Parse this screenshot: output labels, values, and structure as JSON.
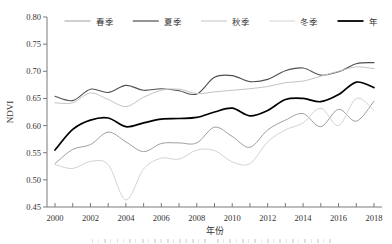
{
  "figure": {
    "caption_note": ""
  },
  "chart_data": {
    "type": "line",
    "title": "",
    "xlabel": "年份",
    "ylabel": "NDVI",
    "xlim": [
      2000,
      2018
    ],
    "ylim": [
      0.45,
      0.8
    ],
    "grid": false,
    "legend_position": "top-center-row",
    "axis_color": "#7a7a7a",
    "text_color": "#333333",
    "x": [
      2000,
      2001,
      2002,
      2003,
      2004,
      2005,
      2006,
      2007,
      2008,
      2009,
      2010,
      2011,
      2012,
      2013,
      2014,
      2015,
      2016,
      2017,
      2018
    ],
    "x_minor_tick_years": [
      2000,
      2001,
      2002,
      2003,
      2004,
      2005,
      2006,
      2007,
      2008,
      2009,
      2010,
      2011,
      2012,
      2013,
      2014,
      2015,
      2016,
      2017,
      2018
    ],
    "x_ticks_labeled": [
      {
        "value": 2000,
        "label": "2000"
      },
      {
        "value": 2002,
        "label": "2002"
      },
      {
        "value": 2004,
        "label": "2004"
      },
      {
        "value": 2006,
        "label": "2006"
      },
      {
        "value": 2008,
        "label": "2008"
      },
      {
        "value": 2010,
        "label": "2010"
      },
      {
        "value": 2012,
        "label": "2012"
      },
      {
        "value": 2014,
        "label": "2014"
      },
      {
        "value": 2016,
        "label": "2016"
      },
      {
        "value": 2018,
        "label": "2018"
      }
    ],
    "y_ticks": [
      {
        "value": 0.8,
        "label": "0.80"
      },
      {
        "value": 0.75,
        "label": "0.75"
      },
      {
        "value": 0.7,
        "label": "0.70"
      },
      {
        "value": 0.65,
        "label": "0.65"
      },
      {
        "value": 0.6,
        "label": "0.60"
      },
      {
        "value": 0.55,
        "label": "0.55"
      },
      {
        "value": 0.5,
        "label": "0.50"
      },
      {
        "value": 0.45,
        "label": "0.45"
      }
    ],
    "series": [
      {
        "key": "spring",
        "name": "春季",
        "color": "#9e9e9e",
        "width": 1.0,
        "values": [
          0.53,
          0.556,
          0.565,
          0.588,
          0.57,
          0.552,
          0.567,
          0.568,
          0.568,
          0.597,
          0.58,
          0.56,
          0.592,
          0.61,
          0.622,
          0.598,
          0.63,
          0.608,
          0.645
        ]
      },
      {
        "key": "summer",
        "name": "夏季",
        "color": "#4f4f4f",
        "width": 1.1,
        "values": [
          0.654,
          0.646,
          0.667,
          0.661,
          0.674,
          0.665,
          0.668,
          0.664,
          0.658,
          0.689,
          0.692,
          0.681,
          0.685,
          0.701,
          0.706,
          0.693,
          0.699,
          0.714,
          0.716
        ]
      },
      {
        "key": "autumn",
        "name": "秋季",
        "color": "#c3c3c3",
        "width": 1.0,
        "values": [
          0.642,
          0.642,
          0.66,
          0.648,
          0.635,
          0.652,
          0.665,
          0.667,
          0.659,
          0.662,
          0.665,
          0.668,
          0.672,
          0.679,
          0.682,
          0.691,
          0.7,
          0.708,
          0.705
        ]
      },
      {
        "key": "winter",
        "name": "冬季",
        "color": "#d3d3d3",
        "width": 1.0,
        "values": [
          0.528,
          0.521,
          0.534,
          0.528,
          0.463,
          0.52,
          0.54,
          0.538,
          0.555,
          0.554,
          0.533,
          0.53,
          0.57,
          0.592,
          0.605,
          0.632,
          0.6,
          0.65,
          0.628
        ]
      },
      {
        "key": "annual",
        "name": "年",
        "color": "#000000",
        "width": 1.7,
        "values": [
          0.555,
          0.593,
          0.61,
          0.614,
          0.598,
          0.605,
          0.612,
          0.613,
          0.615,
          0.625,
          0.632,
          0.618,
          0.628,
          0.648,
          0.65,
          0.644,
          0.657,
          0.68,
          0.67
        ]
      }
    ]
  }
}
